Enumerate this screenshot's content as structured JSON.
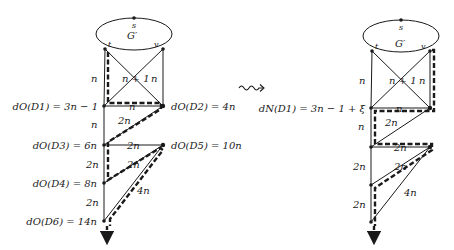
{
  "figure": {
    "transform_symbol": "squiggly-right-arrow",
    "colors": {
      "ink": "#1a1a1a",
      "background": "#ffffff"
    }
  },
  "left": {
    "graph_label": "G′",
    "nodes": {
      "s": "s",
      "t": "t",
      "v": "v"
    },
    "edge_labels": {
      "t_D1": "n",
      "cross": "n + 1",
      "v_D2": "n",
      "D1_D2": "n",
      "D1_D3": "n",
      "D3_D2": "2n",
      "D3_D5": "2n",
      "D4_D5": "2n",
      "D3_D4": "2n",
      "D4_D6": "2n",
      "D6_D5": "4n"
    },
    "distance_labels": {
      "D1": "dO(D1) = 3n − 1",
      "D2": "dO(D2) = 4n",
      "D3": "dO(D3) = 6n",
      "D5": "dO(D5) = 10n",
      "D4": "dO(D4) = 8n",
      "D6": "dO(D6) = 14n"
    }
  },
  "right": {
    "graph_label": "G′",
    "nodes": {
      "s": "s",
      "t": "t",
      "v": "v"
    },
    "edge_labels": {
      "t_D1": "n",
      "cross": "n + 1",
      "v_D2": "n",
      "D1_D2": "n",
      "D1_D3": "n",
      "D3_D2": "2n",
      "D3_D5": "2n",
      "D4_D5": "2n",
      "D3_D4": "2n",
      "D4_D6": "2n",
      "D6_D5": "4n"
    },
    "distance_labels": {
      "D1": "dN(D1) = 3n − 1 + ξ"
    }
  }
}
